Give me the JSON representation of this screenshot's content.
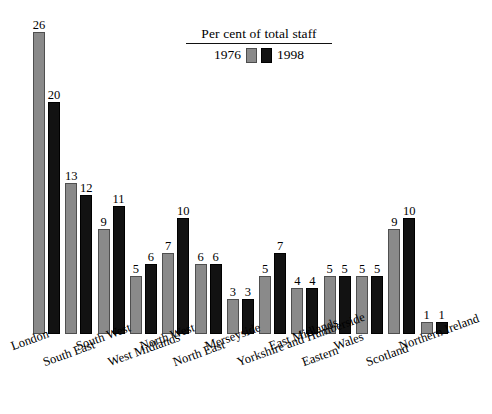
{
  "chart_data": {
    "type": "bar",
    "title": "",
    "xlabel": "",
    "ylabel": "",
    "grid": false,
    "ylim": [
      0,
      26
    ],
    "legend_position": "top-center",
    "legend_title": "Per cent of total staff",
    "categories": [
      "London",
      "South East",
      "South West",
      "West Midlands",
      "North West",
      "North East",
      "Merseyside",
      "Yorkshire and Humberside",
      "East Midlands",
      "Eastern",
      "Wales",
      "Scotland",
      "Northern Ireland"
    ],
    "series": [
      {
        "name": "1976",
        "color": "#8a8a8a",
        "values": [
          26,
          13,
          9,
          5,
          7,
          6,
          3,
          5,
          4,
          5,
          5,
          9,
          1
        ]
      },
      {
        "name": "1998",
        "color": "#121212",
        "values": [
          20,
          12,
          11,
          6,
          10,
          6,
          3,
          7,
          4,
          5,
          5,
          10,
          1
        ]
      }
    ]
  },
  "legend": {
    "title": "Per cent of total staff",
    "entries": [
      {
        "label": "1976",
        "swatch": "gray-swatch"
      },
      {
        "label": "1998",
        "swatch": "black-swatch"
      }
    ]
  }
}
